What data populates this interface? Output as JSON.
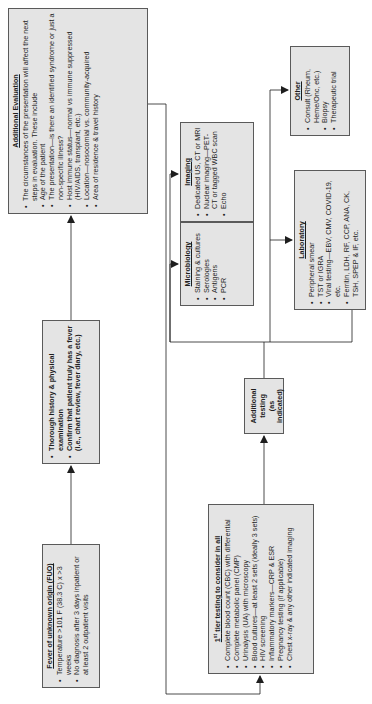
{
  "diagram": {
    "orientation": "rotated-90-ccw",
    "colors": {
      "box_fill": "#e4e4e4",
      "box_border": "#5a5a5a",
      "line": "#1e1e1e",
      "background": "#ffffff"
    },
    "fuo": {
      "title": "Fever of unknown origin (FUO)",
      "bullets": [
        "Temperature >101 F (38.3 C) x >3 weeks",
        "No diagnosis after 3 days inpatient or at least 2 outpatient visits"
      ]
    },
    "history": {
      "bullets": [
        "Thorough history & physical examination",
        "Confirm that patient truly has a fever (i.e., chart review, fever diary, etc.)"
      ]
    },
    "additional_evaluation": {
      "title": "Additional Evaluation",
      "intro": "The circumstances of the presentation will affect the next steps in evaluation. These include",
      "bullets": [
        "Age of the patient",
        "The presentation—is there an identified syndrome or just a non-specific illness?",
        "Host immune status—normal vs immune suppressed (HIV/AIDS, transplant, etc.)",
        "Location—nosocomial vs. community-acquired",
        "Area of residence & travel history"
      ]
    },
    "first_tier": {
      "title": "1st tier testing to consider in all",
      "title_prefix": "1",
      "title_sup": "st",
      "title_rest": " tier testing to consider in all",
      "bullets": [
        "Complete blood count (CBC) with differential",
        "Complete metabolic panel (CMP)",
        "Urinalysis (UA) with microscopy",
        "Blood cultures—at least 2 sets (ideally 3 sets)",
        "HIV screening",
        "Inflammatory markers—CRP & ESR",
        "Pregnancy testing (if applicable)",
        "Chest x-ray & any other indicated imaging"
      ]
    },
    "additional_testing": {
      "line1": "Additional",
      "line2": "testing",
      "line3": "(as indicated)"
    },
    "microbiology": {
      "title": "Microbiology",
      "bullets": [
        "Staining & cultures",
        "Serologies",
        "Antigens",
        "PCR"
      ]
    },
    "imaging": {
      "title": "Imaging",
      "bullets": [
        "Dedicated US, CT or MRI",
        "Nuclear imaging—PET-CT or tagged WBC scan",
        "Echo"
      ]
    },
    "laboratory": {
      "title": "Laboratory",
      "bullets": [
        "Peripheral smear",
        "TST or IGRA",
        "Viral testing—EBV, CMV, COVID-19, etc.",
        "Ferritin, LDH, RF, CCP, ANA, CK, TSH, SPEP & IF, etc."
      ]
    },
    "other": {
      "title": "Other",
      "bullets": [
        "Consult (Rheum, Heme/Onc, etc.)",
        "Biopsy",
        "Therapeutic trial"
      ]
    }
  }
}
